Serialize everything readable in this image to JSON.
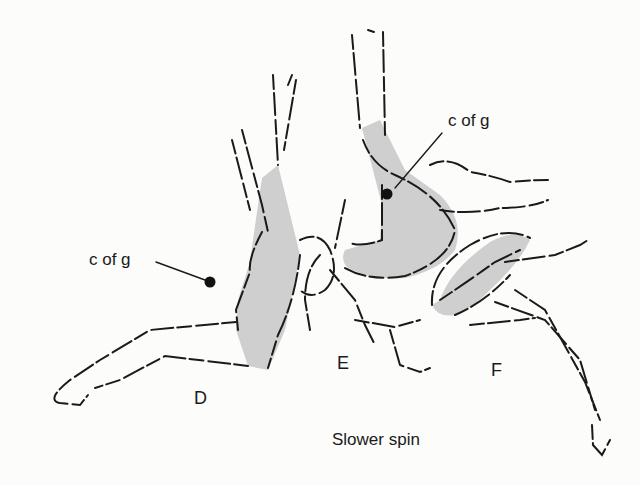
{
  "figure": {
    "caption": "Slower spin",
    "positions": [
      {
        "id": "D",
        "label": "D",
        "cofg_label": "c of g"
      },
      {
        "id": "E",
        "label": "E",
        "cofg_label": "c of g"
      },
      {
        "id": "F",
        "label": "F"
      }
    ],
    "colors": {
      "ink": "#1a1a1a",
      "body_shade": "#cfcfcf",
      "background": "#fcfcfa"
    }
  }
}
